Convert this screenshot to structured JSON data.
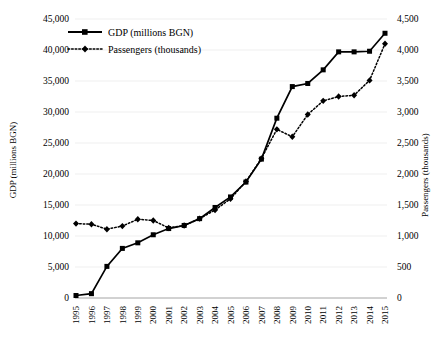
{
  "chart_data": {
    "type": "line",
    "title": "",
    "xlabel": "",
    "ylabel": "GDP (millions BGN)",
    "y2label": "Passengers (thousands)",
    "grid": true,
    "legend_position": "top-left",
    "categories": [
      "1995",
      "1996",
      "1997",
      "1998",
      "1999",
      "2000",
      "2001",
      "2002",
      "2003",
      "2004",
      "2005",
      "2006",
      "2007",
      "2008",
      "2009",
      "2010",
      "2011",
      "2012",
      "2013",
      "2014",
      "2015"
    ],
    "ylim": [
      0,
      45000
    ],
    "yticks": [
      "0",
      "5,000",
      "10,000",
      "15,000",
      "20,000",
      "25,000",
      "30,000",
      "35,000",
      "40,000",
      "45,000"
    ],
    "ytick_values": [
      0,
      5000,
      10000,
      15000,
      20000,
      25000,
      30000,
      35000,
      40000,
      45000
    ],
    "y2lim": [
      0,
      4500
    ],
    "y2ticks": [
      "0",
      "500",
      "1,000",
      "1,500",
      "2,000",
      "2,500",
      "3,000",
      "3,500",
      "4,000",
      "4,500"
    ],
    "y2tick_values": [
      0,
      500,
      1000,
      1500,
      2000,
      2500,
      3000,
      3500,
      4000,
      4500
    ],
    "series": [
      {
        "name": "GDP (millions BGN)",
        "axis": "left",
        "marker": "square",
        "linestyle": "solid",
        "color": "#000000",
        "values": [
          400,
          700,
          5100,
          8000,
          8900,
          10200,
          11200,
          11700,
          12800,
          14600,
          16300,
          18700,
          22400,
          29000,
          34100,
          34600,
          36800,
          39700,
          39700,
          39800,
          42700
        ]
      },
      {
        "name": "Passengers (thousands)",
        "axis": "right",
        "marker": "diamond",
        "linestyle": "dotted",
        "color": "#000000",
        "values": [
          1200,
          1190,
          1110,
          1160,
          1270,
          1250,
          1130,
          1170,
          1280,
          1420,
          1600,
          1880,
          2250,
          2720,
          2600,
          2960,
          3180,
          3250,
          3270,
          3510,
          4100
        ]
      }
    ],
    "legend": [
      {
        "label": "GDP (millions BGN)",
        "marker": "square",
        "linestyle": "solid"
      },
      {
        "label": "Passengers (thousands)",
        "marker": "diamond",
        "linestyle": "dotted"
      }
    ]
  }
}
